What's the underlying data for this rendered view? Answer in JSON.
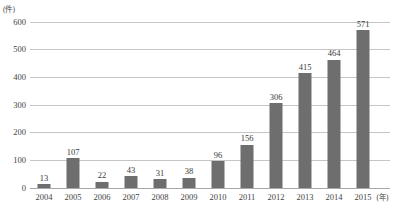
{
  "chart_data": {
    "type": "bar",
    "title": "",
    "xlabel": "(年)",
    "ylabel": "(件)",
    "categories": [
      "2004",
      "2005",
      "2006",
      "2007",
      "2008",
      "2009",
      "2010",
      "2011",
      "2012",
      "2013",
      "2014",
      "2015"
    ],
    "values": [
      13,
      107,
      22,
      43,
      31,
      38,
      96,
      156,
      306,
      415,
      464,
      571
    ],
    "ylim": [
      0,
      600
    ],
    "yticks": [
      0,
      100,
      200,
      300,
      400,
      500,
      600
    ],
    "ytick_labels": [
      "0",
      "100",
      "200",
      "300",
      "400",
      "500",
      "600"
    ],
    "grid": true,
    "legend": false,
    "bar_color": "#6e6e6e",
    "grid_color": "#c5c5c5",
    "axis_color": "#a8a8a8",
    "background_color": "#ffffff",
    "data_labels": [
      "13",
      "107",
      "22",
      "43",
      "31",
      "38",
      "96",
      "156",
      "306",
      "415",
      "464",
      "571"
    ]
  },
  "axis": {
    "unit_y": "(件)",
    "unit_x": "(年)"
  },
  "header": {
    "cropped_title": ""
  }
}
